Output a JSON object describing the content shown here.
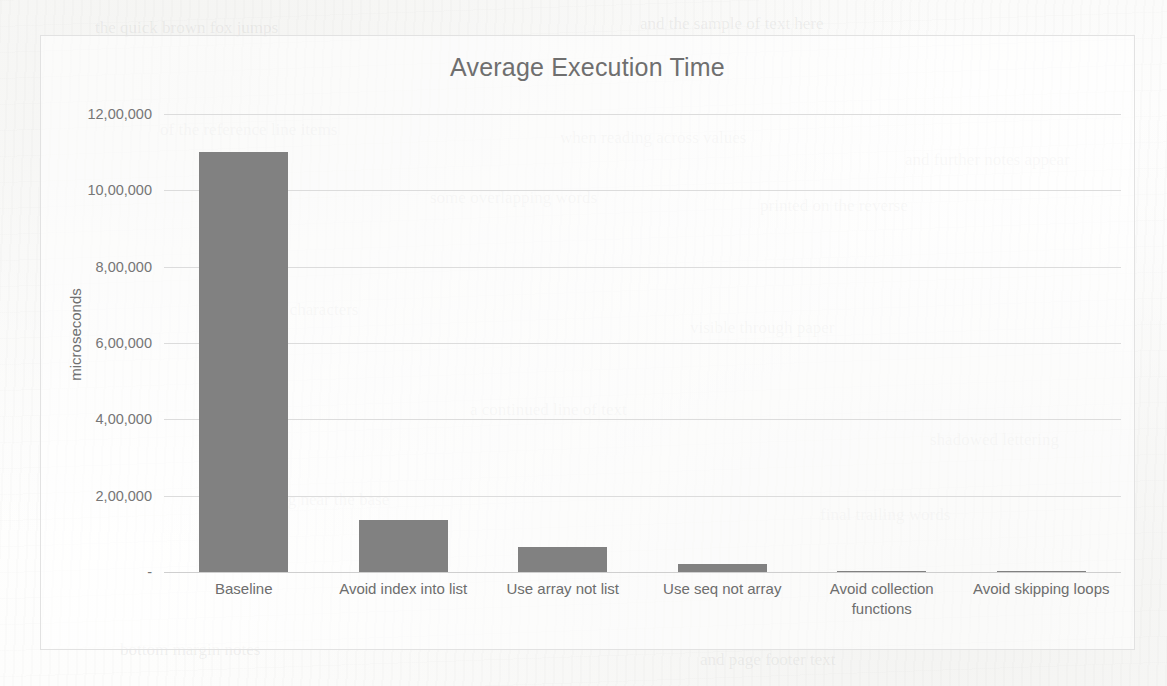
{
  "page": {
    "background_color": "#fdfdfc",
    "frame_border_color": "#e2e2e2"
  },
  "chart_data": {
    "type": "bar",
    "title": "Average Execution Time",
    "xlabel": "",
    "ylabel": "microseconds",
    "categories": [
      "Baseline",
      "Avoid index into list",
      "Use array not list",
      "Use seq not array",
      "Avoid collection functions",
      "Avoid skipping loops"
    ],
    "values": [
      1100000,
      135000,
      65000,
      20000,
      2000,
      1500
    ],
    "ylim": [
      0,
      1200000
    ],
    "ytick_values": [
      0,
      200000,
      400000,
      600000,
      800000,
      1000000,
      1200000
    ],
    "ytick_labels": [
      "-",
      "2,00,000",
      "4,00,000",
      "6,00,000",
      "8,00,000",
      "10,00,000",
      "12,00,000"
    ],
    "grid": true,
    "gridline_color": "#dcdcdc",
    "bar_color": "#818181",
    "legend": false,
    "legend_position": "none",
    "title_color": "#6f6f6f",
    "tick_label_color": "#767676"
  },
  "ghost_marks": [
    {
      "text": "the quick brown fox jumps",
      "left": 95,
      "top": 18
    },
    {
      "text": "and the sample of text here",
      "left": 640,
      "top": 14
    },
    {
      "text": "of the reference line items",
      "left": 160,
      "top": 120
    },
    {
      "text": "when reading across values",
      "left": 560,
      "top": 128
    },
    {
      "text": "and further notes appear",
      "left": 905,
      "top": 150
    },
    {
      "text": "some overlapping words",
      "left": 430,
      "top": 188
    },
    {
      "text": "printed on the reverse",
      "left": 760,
      "top": 196
    },
    {
      "text": "more faint characters",
      "left": 215,
      "top": 300
    },
    {
      "text": "visible through paper",
      "left": 690,
      "top": 318
    },
    {
      "text": "a continued line of text",
      "left": 470,
      "top": 400
    },
    {
      "text": "shadowed lettering",
      "left": 930,
      "top": 430
    },
    {
      "text": "ending near the base",
      "left": 250,
      "top": 490
    },
    {
      "text": "final trailing words",
      "left": 820,
      "top": 505
    },
    {
      "text": "bottom margin notes",
      "left": 120,
      "top": 640
    },
    {
      "text": "and page footer text",
      "left": 700,
      "top": 650
    }
  ]
}
